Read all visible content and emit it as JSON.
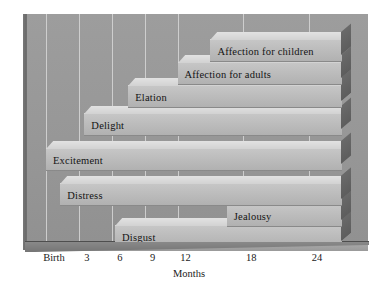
{
  "chart_data": {
    "type": "bar",
    "orientation": "horizontal",
    "title": "",
    "xlabel": "Months",
    "ylabel": "",
    "xlim": [
      0,
      27
    ],
    "tick_labels": [
      "Birth",
      "3",
      "6",
      "9",
      "12",
      "18",
      "24"
    ],
    "tick_values": [
      0,
      3,
      6,
      9,
      12,
      18,
      24
    ],
    "grid": "vertical",
    "legend": "none",
    "categories": [
      "Affection for children",
      "Affection for adults",
      "Elation",
      "Delight",
      "Excitement",
      "Distress",
      "Anger",
      "Jealousy",
      "Disgust",
      "Fear"
    ],
    "series": [
      {
        "name": "Onset of emotion (months)",
        "bars": [
          {
            "label": "Affection for children",
            "start": 15,
            "end": 27,
            "row": 0,
            "label_side": "left"
          },
          {
            "label": "Affection for adults",
            "start": 12,
            "end": 27,
            "row": 1,
            "label_side": "left"
          },
          {
            "label": "Elation",
            "start": 7.5,
            "end": 27,
            "row": 2,
            "label_side": "left"
          },
          {
            "label": "Joy",
            "start": 21,
            "end": 27,
            "row": 2,
            "label_side": "left"
          },
          {
            "label": "Delight",
            "start": 3.5,
            "end": 27,
            "row": 3,
            "label_side": "left"
          },
          {
            "label": "Excitement",
            "start": 0,
            "end": 27,
            "row": 4,
            "label_side": "left"
          },
          {
            "label": "Distress",
            "start": 1.3,
            "end": 27,
            "row": 5,
            "label_side": "left"
          },
          {
            "label": "Anger",
            "start": 5.2,
            "end": 27,
            "row": 6,
            "label_side": "left"
          },
          {
            "label": "Jealousy",
            "start": 16.5,
            "end": 27,
            "row": 6,
            "label_side": "left"
          },
          {
            "label": "Disgust",
            "start": 6.3,
            "end": 27,
            "row": 7,
            "label_side": "left"
          },
          {
            "label": "Fear",
            "start": 7.2,
            "end": 27,
            "row": 8,
            "label_side": "left"
          }
        ]
      }
    ],
    "colors": {
      "panel_background": "#979797",
      "bar_face": "#bdbdbd",
      "bar_top": "#d9d9d9",
      "bar_side": "#636363",
      "gridline": "#d7d7d7",
      "text": "#141414",
      "base": "#8b8b8b"
    }
  },
  "axis": {
    "title": "Months",
    "ticks": [
      {
        "label": "Birth",
        "x": 0
      },
      {
        "label": "3",
        "x": 3
      },
      {
        "label": "6",
        "x": 6
      },
      {
        "label": "9",
        "x": 9
      },
      {
        "label": "12",
        "x": 12
      },
      {
        "label": "18",
        "x": 18
      },
      {
        "label": "24",
        "x": 24
      }
    ]
  },
  "bars": [
    {
      "label": "Affection for children"
    },
    {
      "label": "Affection for adults"
    },
    {
      "label": "Elation"
    },
    {
      "label": "Joy"
    },
    {
      "label": "Delight"
    },
    {
      "label": "Excitement"
    },
    {
      "label": "Distress"
    },
    {
      "label": "Anger"
    },
    {
      "label": "Jealousy"
    },
    {
      "label": "Disgust"
    },
    {
      "label": "Fear"
    }
  ]
}
